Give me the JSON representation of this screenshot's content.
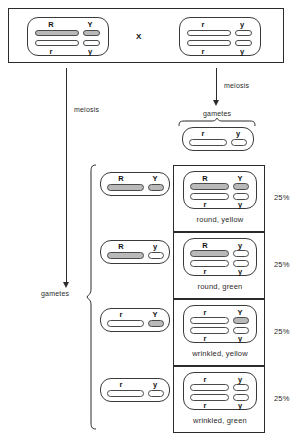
{
  "diagram": {
    "cross_symbol": "X",
    "colors": {
      "dominant_fill": "#b9b9b9",
      "recessive_fill": "#ffffff",
      "ink": "#2b2b2b"
    }
  },
  "parents": {
    "label_left": "meiosis",
    "label_right": "meiosis",
    "mother": {
      "name": "parent-cell-RrYy",
      "top_left_allele": "R",
      "top_right_allele": "Y",
      "bottom_left_allele": "r",
      "bottom_right_allele": "y",
      "top_left_dominant": true,
      "top_right_dominant": true,
      "bottom_left_dominant": false,
      "bottom_right_dominant": false
    },
    "father": {
      "name": "parent-cell-rryy",
      "top_left_allele": "r",
      "top_right_allele": "y",
      "bottom_left_allele": "r",
      "bottom_right_allele": "y",
      "top_left_dominant": false,
      "top_right_dominant": false,
      "bottom_left_dominant": false,
      "bottom_right_dominant": false
    }
  },
  "gametes": {
    "left_label": "gametes",
    "right_label": "gametes",
    "father_gamete": {
      "left_allele": "r",
      "right_allele": "y",
      "left_dominant": false,
      "right_dominant": false
    },
    "mother_gametes": [
      {
        "left_allele": "R",
        "right_allele": "Y",
        "left_dominant": true,
        "right_dominant": true
      },
      {
        "left_allele": "R",
        "right_allele": "y",
        "left_dominant": true,
        "right_dominant": false
      },
      {
        "left_allele": "r",
        "right_allele": "Y",
        "left_dominant": false,
        "right_dominant": true
      },
      {
        "left_allele": "r",
        "right_allele": "y",
        "left_dominant": false,
        "right_dominant": false
      }
    ]
  },
  "offspring": [
    {
      "top_left_allele": "R",
      "top_right_allele": "Y",
      "bottom_left_allele": "r",
      "bottom_right_allele": "y",
      "top_left_dominant": true,
      "top_right_dominant": true,
      "bottom_left_dominant": false,
      "bottom_right_dominant": false,
      "phenotype": "round, yellow",
      "percent": "25%"
    },
    {
      "top_left_allele": "R",
      "top_right_allele": "y",
      "bottom_left_allele": "r",
      "bottom_right_allele": "y",
      "top_left_dominant": true,
      "top_right_dominant": false,
      "bottom_left_dominant": false,
      "bottom_right_dominant": false,
      "phenotype": "round, green",
      "percent": "25%"
    },
    {
      "top_left_allele": "r",
      "top_right_allele": "Y",
      "bottom_left_allele": "r",
      "bottom_right_allele": "y",
      "top_left_dominant": false,
      "top_right_dominant": true,
      "bottom_left_dominant": false,
      "bottom_right_dominant": false,
      "phenotype": "wrinkled, yellow",
      "percent": "25%"
    },
    {
      "top_left_allele": "r",
      "top_right_allele": "y",
      "bottom_left_allele": "r",
      "bottom_right_allele": "y",
      "top_left_dominant": false,
      "top_right_dominant": false,
      "bottom_left_dominant": false,
      "bottom_right_dominant": false,
      "phenotype": "wrinkled, green",
      "percent": "25%"
    }
  ]
}
